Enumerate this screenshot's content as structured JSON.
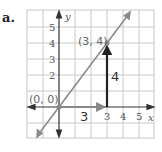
{
  "part_label": "a.",
  "axes": {
    "x_name": "x",
    "y_name": "y",
    "x_ticks": [
      "3",
      "4",
      "5"
    ],
    "y_ticks": [
      "2",
      "3",
      "4",
      "5"
    ]
  },
  "points": [
    {
      "label": "(0, 0)",
      "x": 0,
      "y": 0
    },
    {
      "label": "(3, 4)",
      "x": 3,
      "y": 4
    }
  ],
  "run": {
    "label": "3",
    "value": 3
  },
  "rise": {
    "label": "4",
    "value": 4
  },
  "line": {
    "slope": "4/3",
    "through": [
      "(0, 0)",
      "(3, 4)"
    ]
  },
  "colors": {
    "grid": "#c8c8c8",
    "line": "#8a8a8a",
    "axis": "#333333",
    "rise_arrow": "#222222",
    "run_arrow": "#888888"
  }
}
